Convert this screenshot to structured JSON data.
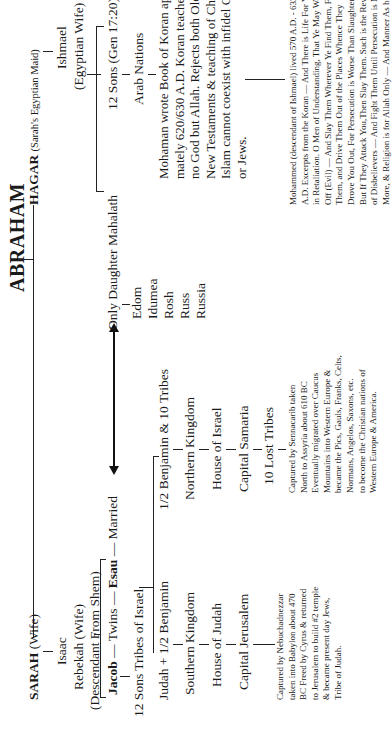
{
  "title": "ABRAHAM",
  "sarah_branch": {
    "sarah": "SARAH",
    "sarah_role": "(Wife)",
    "isaac": "Isaac",
    "rebekah": "Rebekah (Wife)",
    "rebekah_note": "(Descendant From Shem)",
    "jacob": "Jacob",
    "twins": "— Twins —",
    "esau": "Esau",
    "married": "— Married",
    "twelve_tribes": "12 Sons Tribes of Israel",
    "south": {
      "tribes": "Judah + 1/2 Benjamin",
      "kingdom": "Southern Kingdom",
      "house": "House of Judah",
      "capital": "Capital Jerusalem",
      "caption": [
        "Captured by Nebuchadnezzar",
        "taken into Babylon about 470",
        "BC Freed by Cyrus & returned",
        "to Jerusalem to build #2 temple",
        "& became present day Jews,",
        "Tribe of Judah."
      ]
    },
    "north": {
      "tribes": "1/2 Benjamin & 10 Tribes",
      "kingdom": "Northern Kingdom",
      "house": "House of Israel",
      "capital": "Capital Samaria",
      "lost": "10 Lost Tribes",
      "caption": [
        "Captured by Sennacarib taken",
        "North to Assyria about 610 BC",
        "Eventually migrated over Caucus",
        "Mountains into Western Europe &",
        "became the Pics, Gauls, Franks, Celts,",
        "Normans, Angelos, Saxons, etc.",
        "to become the Christian nations of",
        "Western Europe & America."
      ]
    }
  },
  "esau_branch": {
    "daughter": "Only Daughter Mahalath",
    "nations": [
      "Edom",
      "Idumea",
      "Rosh",
      "Russ",
      "Russia"
    ]
  },
  "hagar_branch": {
    "hagar": "HAGAR",
    "hagar_role": "(Sarah's Egyptian Maid)",
    "ishmael": "Ishmael",
    "ishmael_role": "(Egyptian Wife)",
    "twelve_sons": "12 Sons (Gen 17:20)",
    "arab": "Arab Nations",
    "koran_text": [
      "Mohaman wrote Book of Koran approxi-",
      "mately  620/630 A.D. Koran teaches there is",
      "no God but Allah. Rejects both Old and",
      "New Testaments & teaching of Christ.",
      "Islam cannot coexist with infidel Christians",
      "or Jews."
    ],
    "mohammed_caption": [
      "Mohammed (descendant of Ishmael) lived 570 A.D. - 632",
      "A.D. Excerpts from the Koran — And There is Life For You",
      "in Retaliation. O Men of Understanding, That Ye May Ward",
      "Off (Evil) — And Slay Them Wherever Ye Find Them, Find",
      "Them, and Drive Them Out of the Places Whence They",
      "Drove You Out, For Persecution is Worse Than Slaughter —",
      "But If They Attack You,Then Slay Them. Such is the Reward",
      "of Disbelievers — And Fight Them Until Persecution is No",
      "More, & Religion is for Allah Only — And Manner As he"
    ]
  }
}
